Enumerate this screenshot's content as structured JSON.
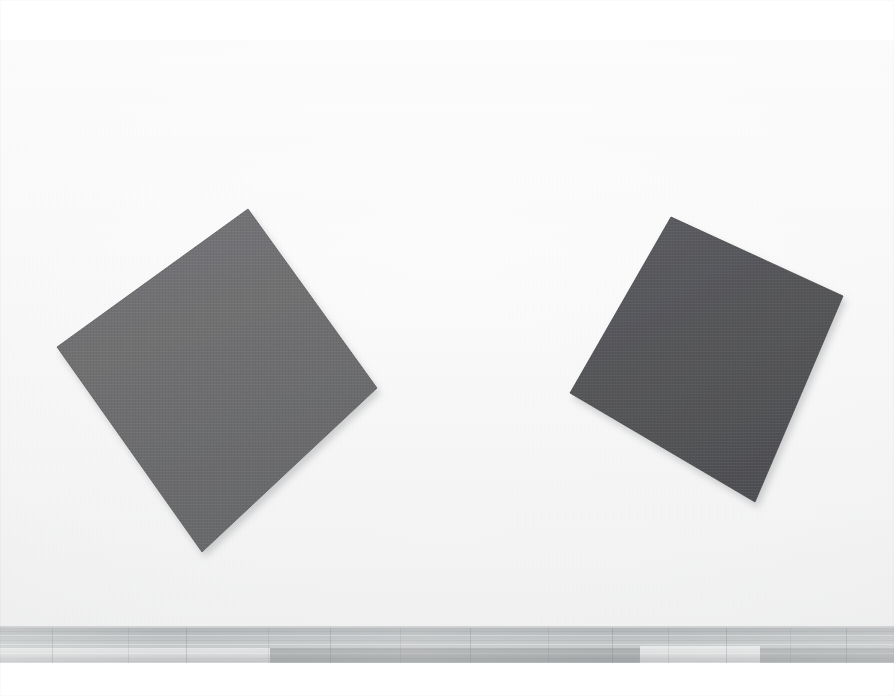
{
  "scene": {
    "title": "Gallery wall with two tilted monochrome square panels",
    "width": 894,
    "height": 696,
    "caption": ""
  },
  "photo": {
    "letterbox_color": "#ffffff",
    "letterbox_top_height": 40,
    "letterbox_bottom_top": 663,
    "letterbox_bottom_height": 33
  },
  "wall": {
    "label": "gallery wall",
    "color": "#f7f7f7",
    "highlight_color": "#fcfcfc",
    "shadow_color": "#ededee",
    "top": 40,
    "height": 589
  },
  "baseboard": {
    "label": "wall base trim",
    "color": "#c5c8ca",
    "top": 626,
    "height": 3
  },
  "floor": {
    "label": "wooden plank floor",
    "base_color": "#c2c5c6",
    "dark_color": "#b0b3b5",
    "light_color": "#d6d8d9",
    "seam_color": "#787c7f",
    "top": 628,
    "height": 35,
    "plank_seams_x": [
      52,
      128,
      186,
      268,
      330,
      400,
      470,
      548,
      612,
      668,
      726,
      790,
      846
    ]
  },
  "artworks": [
    {
      "id": "panel-left",
      "label": "left panel",
      "shape": "tilted square",
      "fill": "#6f6f70",
      "fill_light": "#77777a",
      "fill_dark": "#696a6c",
      "edge": "#5d5e60",
      "points": "248,209 377,388 202,552 57,347",
      "shadow_points": "252,213 381,392 206,556 61,351",
      "rotation_deg": 45
    },
    {
      "id": "panel-right",
      "label": "right panel",
      "shape": "tilted square",
      "fill": "#555659",
      "fill_light": "#5b5c60",
      "fill_dark": "#4f5053",
      "edge": "#46474a",
      "points": "671,217 843,296 755,502 570,393",
      "shadow_points": "675,221 847,300 759,506 574,397",
      "rotation_deg": 27
    }
  ]
}
